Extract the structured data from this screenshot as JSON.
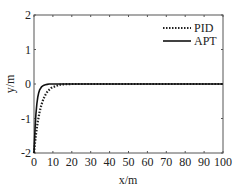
{
  "chart_data": {
    "type": "line",
    "title": "",
    "xlabel": "x/m",
    "ylabel": "y/m",
    "xlim": [
      0,
      100
    ],
    "ylim": [
      -2,
      2
    ],
    "xticks": [
      0,
      10,
      20,
      30,
      40,
      50,
      60,
      70,
      80,
      90,
      100
    ],
    "yticks": [
      -2,
      -1,
      0,
      1,
      2
    ],
    "grid": false,
    "legend_position": "upper right",
    "series": [
      {
        "name": "PID",
        "style": "dotted",
        "color": "#222222",
        "x": [
          0,
          0.5,
          1,
          1.5,
          2,
          3,
          4,
          5,
          6,
          7,
          8,
          9,
          10,
          11,
          12,
          13,
          14,
          15,
          20,
          30,
          40,
          50,
          60,
          70,
          80,
          90,
          100
        ],
        "y": [
          -2,
          -1.72,
          -1.48,
          -1.27,
          -1.09,
          -0.8,
          -0.59,
          -0.43,
          -0.32,
          -0.23,
          -0.17,
          -0.12,
          -0.09,
          -0.07,
          -0.05,
          -0.03,
          -0.02,
          -0.01,
          0,
          0,
          0,
          0,
          0,
          0,
          0,
          0,
          0
        ]
      },
      {
        "name": "APT",
        "style": "solid",
        "color": "#111111",
        "x": [
          0,
          0.3,
          0.6,
          1,
          1.5,
          2,
          2.5,
          3,
          4,
          5,
          6,
          7,
          8,
          10,
          12,
          15,
          20,
          30,
          40,
          50,
          60,
          70,
          80,
          90,
          100
        ],
        "y": [
          -2,
          -1.6,
          -1.25,
          -0.88,
          -0.58,
          -0.38,
          -0.25,
          -0.17,
          -0.08,
          -0.04,
          -0.02,
          -0.01,
          0,
          0,
          0,
          0,
          0,
          0,
          0,
          0,
          0,
          0,
          0,
          0,
          0
        ]
      }
    ]
  }
}
